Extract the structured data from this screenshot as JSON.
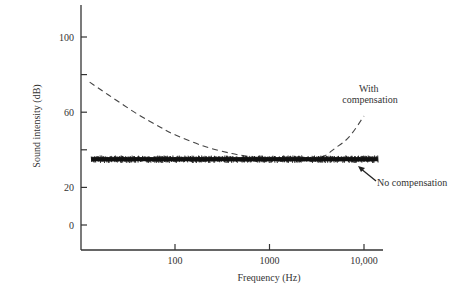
{
  "chart_data": {
    "type": "line",
    "title": "",
    "xlabel": "Frequency (Hz)",
    "ylabel": "Sound intensity (dB)",
    "xscale": "log",
    "xlim": [
      12,
      15000
    ],
    "ylim": [
      -12,
      118
    ],
    "grid": false,
    "x_ticks": [
      {
        "value": 100,
        "label": "100"
      },
      {
        "value": 1000,
        "label": "1000"
      },
      {
        "value": 10000,
        "label": "10,000"
      }
    ],
    "y_ticks": [
      {
        "value": 100,
        "label": "100"
      },
      {
        "value": 80,
        "label": ""
      },
      {
        "value": 60,
        "label": "60"
      },
      {
        "value": 40,
        "label": ""
      },
      {
        "value": 20,
        "label": "20"
      },
      {
        "value": 0,
        "label": "0"
      }
    ],
    "series": [
      {
        "name": "With compensation",
        "style": "dashed",
        "x": [
          12.5,
          20,
          40,
          70,
          100,
          200,
          400,
          700,
          1000,
          2000,
          3500,
          5000,
          7000,
          10000
        ],
        "y": [
          76,
          69,
          59,
          52,
          48,
          42,
          38,
          36,
          35,
          35,
          36,
          41,
          47,
          58
        ]
      },
      {
        "name": "No compensation",
        "style": "solid-noisy",
        "x": [
          13,
          100,
          1000,
          10000,
          14000
        ],
        "y": [
          35,
          35,
          35,
          35,
          35
        ]
      }
    ],
    "annotations": [
      {
        "text_lines": [
          "With",
          "compensation"
        ],
        "target_series": "With compensation"
      },
      {
        "text": "No compensation",
        "target_series": "No compensation",
        "arrow": true
      }
    ]
  }
}
